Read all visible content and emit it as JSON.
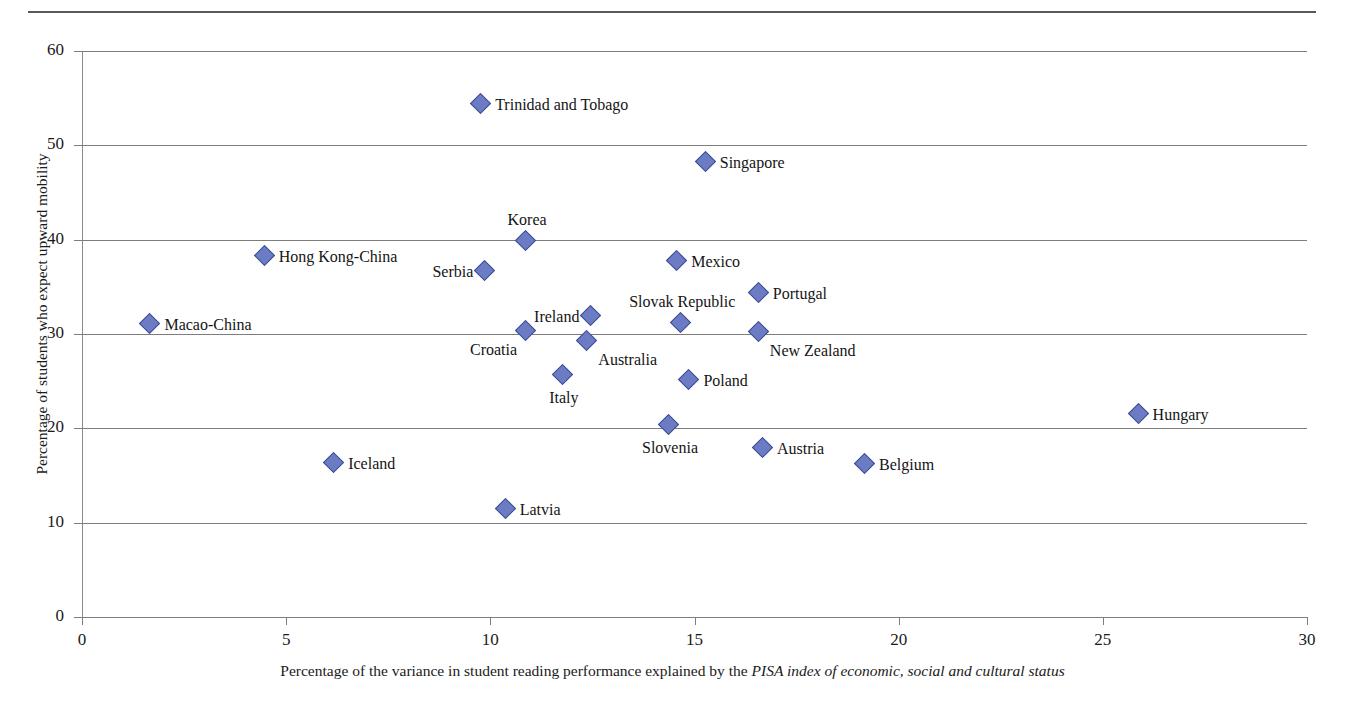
{
  "chart_data": {
    "type": "scatter",
    "title": "",
    "xlabel_plain_1": "Percentage of the variance in student reading performance explained by the ",
    "xlabel_italic": "PISA index of economic, social and cultural status",
    "xlabel": "Percentage of the variance in student reading performance explained by the PISA index of economic, social and cultural status",
    "ylabel": "Percentage of students who expect upward mobility",
    "xlim": [
      0,
      30
    ],
    "ylim": [
      0,
      60
    ],
    "xticks": [
      "0",
      "5",
      "10",
      "15",
      "20",
      "25",
      "30"
    ],
    "yticks": [
      "0",
      "10",
      "20",
      "30",
      "40",
      "50",
      "60"
    ],
    "grid": "horizontal",
    "legend": "none",
    "marker_color": "#6b7cc4",
    "marker_edge_color": "#3b4a8f",
    "marker_shape": "diamond",
    "points": [
      {
        "label": "Trinidad and Tobago",
        "x": 9.8,
        "y": 54.3,
        "pos": "right"
      },
      {
        "label": "Singapore",
        "x": 15.3,
        "y": 48.1,
        "pos": "right"
      },
      {
        "label": "Korea",
        "x": 10.9,
        "y": 39.8,
        "pos": "above"
      },
      {
        "label": "Hong Kong-China",
        "x": 4.5,
        "y": 38.2,
        "pos": "right"
      },
      {
        "label": "Mexico",
        "x": 14.6,
        "y": 37.6,
        "pos": "right"
      },
      {
        "label": "Serbia",
        "x": 9.9,
        "y": 36.6,
        "pos": "left"
      },
      {
        "label": "Portugal",
        "x": 16.6,
        "y": 34.2,
        "pos": "right"
      },
      {
        "label": "Ireland",
        "x": 12.5,
        "y": 31.8,
        "pos": "left"
      },
      {
        "label": "Slovak Republic",
        "x": 14.7,
        "y": 31.1,
        "pos": "above"
      },
      {
        "label": "Macao-China",
        "x": 1.7,
        "y": 31.0,
        "pos": "right"
      },
      {
        "label": "Croatia",
        "x": 10.9,
        "y": 30.2,
        "pos": "below-left"
      },
      {
        "label": "New Zealand",
        "x": 16.6,
        "y": 30.1,
        "pos": "below-right"
      },
      {
        "label": "Australia",
        "x": 12.4,
        "y": 29.1,
        "pos": "below-right"
      },
      {
        "label": "Italy",
        "x": 11.8,
        "y": 25.6,
        "pos": "below"
      },
      {
        "label": "Poland",
        "x": 14.9,
        "y": 25.0,
        "pos": "right"
      },
      {
        "label": "Hungary",
        "x": 25.9,
        "y": 21.4,
        "pos": "right"
      },
      {
        "label": "Slovenia",
        "x": 14.4,
        "y": 20.2,
        "pos": "below"
      },
      {
        "label": "Austria",
        "x": 16.7,
        "y": 17.8,
        "pos": "right"
      },
      {
        "label": "Iceland",
        "x": 6.2,
        "y": 16.2,
        "pos": "right"
      },
      {
        "label": "Belgium",
        "x": 19.2,
        "y": 16.1,
        "pos": "right"
      },
      {
        "label": "Latvia",
        "x": 10.4,
        "y": 11.3,
        "pos": "right"
      }
    ]
  }
}
